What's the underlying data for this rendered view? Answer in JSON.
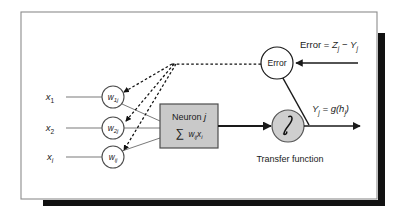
{
  "figure": {
    "frame": {
      "border_color": "#8c8c8c",
      "shadow_color": "#111111",
      "background": "#ffffff"
    },
    "colors": {
      "stroke": "#1a1a1a",
      "input_line": "#7a7a7a",
      "weight_line": "#7a7a7a",
      "neuron_fill": "#c9c9c9",
      "neuron_stroke": "#4d4d4d",
      "transfer_fill": "#cfcfcf",
      "transfer_stroke": "#555555",
      "error_fill": "#ffffff",
      "dashed": "#111111"
    },
    "inputs": [
      {
        "name": "x-1",
        "base": "x",
        "sub": "1"
      },
      {
        "name": "x-2",
        "base": "x",
        "sub": "2"
      },
      {
        "name": "x-i",
        "base": "x",
        "sub": "i"
      }
    ],
    "weights": [
      {
        "name": "w-1j",
        "base": "w",
        "sub": "1j"
      },
      {
        "name": "w-2j",
        "base": "w",
        "sub": "2j"
      },
      {
        "name": "w-ij",
        "base": "w",
        "sub": "ij"
      }
    ],
    "neuron_box": {
      "line1": "Neuron",
      "line1_index": "j",
      "sigma": "∑",
      "sum_w": "w",
      "sum_w_sub": "ij",
      "sum_x": "x",
      "sum_x_sub": "i"
    },
    "transfer": {
      "glyph": "∫",
      "caption": "Transfer function"
    },
    "output": {
      "base": "Y",
      "sub": "j",
      "equals": "= g(",
      "h_base": "h",
      "h_sub": "j",
      "close": ")"
    },
    "error_node": {
      "label": "Error"
    },
    "error_formula": {
      "lead": "Error =",
      "z_base": "Z",
      "z_sub": "j",
      "minus": "−",
      "y_base": "Y",
      "y_sub": "j"
    }
  }
}
